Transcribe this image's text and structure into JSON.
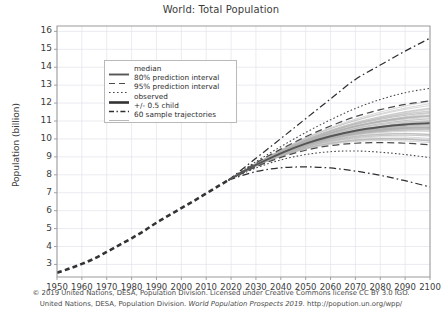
{
  "chart_data": {
    "type": "line",
    "title": "World: Total Population",
    "xlabel": "",
    "ylabel": "Population (billion)",
    "xlim": [
      1950,
      2100
    ],
    "ylim": [
      2.3,
      16.3
    ],
    "yticks": [
      3,
      4,
      5,
      6,
      7,
      8,
      9,
      10,
      11,
      12,
      13,
      14,
      15,
      16
    ],
    "xticks": [
      1950,
      1960,
      1970,
      1980,
      1990,
      2000,
      2010,
      2020,
      2030,
      2040,
      2050,
      2060,
      2070,
      2080,
      2090,
      2100
    ],
    "grid": true,
    "legend_position": "upper-left",
    "series": [
      {
        "name": "observed",
        "style": "thick-dashed",
        "x": [
          1950,
          1955,
          1960,
          1965,
          1970,
          1975,
          1980,
          1985,
          1990,
          1995,
          2000,
          2005,
          2010,
          2015,
          2019
        ],
        "values": [
          2.54,
          2.77,
          3.03,
          3.33,
          3.7,
          4.08,
          4.46,
          4.87,
          5.33,
          5.74,
          6.14,
          6.54,
          6.96,
          7.38,
          7.71
        ]
      },
      {
        "name": "median",
        "style": "solid",
        "x": [
          2019,
          2030,
          2040,
          2050,
          2060,
          2070,
          2080,
          2090,
          2100
        ],
        "values": [
          7.71,
          8.55,
          9.2,
          9.74,
          10.15,
          10.46,
          10.67,
          10.81,
          10.88
        ]
      },
      {
        "name": "80% prediction interval",
        "style": "dashed",
        "bounds": {
          "x": [
            2019,
            2030,
            2040,
            2050,
            2060,
            2070,
            2080,
            2090,
            2100
          ],
          "upper": [
            7.71,
            8.66,
            9.43,
            10.12,
            10.72,
            11.24,
            11.63,
            11.93,
            12.12
          ],
          "lower": [
            7.71,
            8.44,
            8.97,
            9.37,
            9.63,
            9.76,
            9.8,
            9.76,
            9.68
          ]
        }
      },
      {
        "name": "95% prediction interval",
        "style": "dotted",
        "bounds": {
          "x": [
            2019,
            2030,
            2040,
            2050,
            2060,
            2070,
            2080,
            2090,
            2100
          ],
          "upper": [
            7.71,
            8.73,
            9.57,
            10.36,
            11.07,
            11.7,
            12.2,
            12.58,
            12.82
          ],
          "lower": [
            7.71,
            8.38,
            8.83,
            9.13,
            9.29,
            9.33,
            9.26,
            9.13,
            8.96
          ]
        }
      },
      {
        "name": "+/- 0.5 child",
        "style": "dash-dot",
        "bounds": {
          "x": [
            2019,
            2030,
            2040,
            2050,
            2060,
            2070,
            2080,
            2090,
            2100
          ],
          "upper": [
            7.71,
            8.92,
            10.02,
            11.13,
            12.23,
            13.32,
            14.12,
            14.9,
            15.62
          ],
          "lower": [
            7.71,
            8.18,
            8.39,
            8.44,
            8.38,
            8.21,
            7.97,
            7.67,
            7.32
          ]
        }
      },
      {
        "name": "60 sample trajectories",
        "style": "thin-gray",
        "count": 60,
        "x": [
          2019,
          2030,
          2040,
          2050,
          2060,
          2070,
          2080,
          2090,
          2100
        ],
        "spread_at_2100": [
          9.4,
          12.2
        ]
      }
    ],
    "colors": {
      "median": "#555555",
      "observed": "#333333",
      "interval": "#4a4a4a",
      "trajectories": "#b0b0b0",
      "grid": "#e3e3ec",
      "frame": "#9a9a9a",
      "text": "#3c3c3c"
    }
  },
  "legend": {
    "items": [
      {
        "label": "median",
        "key": "solid"
      },
      {
        "label": "80% prediction interval",
        "key": "dashed"
      },
      {
        "label": "95% prediction interval",
        "key": "dotted"
      },
      {
        "label": "observed",
        "key": "thick-dashed"
      },
      {
        "label": "+/- 0.5 child",
        "key": "dash-dot"
      },
      {
        "label": "60 sample trajectories",
        "key": "thin-gray"
      }
    ]
  },
  "footer": {
    "line1": "© 2019 United Nations, DESA, Population Division. Licensed under Creative Commons license CC BY 3.0 IGO.",
    "line2_part1": "United Nations, DESA, Population Division. ",
    "line2_italic": "World Population Prospects 2019.",
    "line2_part2": " http://popution.un.org/wpp/"
  }
}
